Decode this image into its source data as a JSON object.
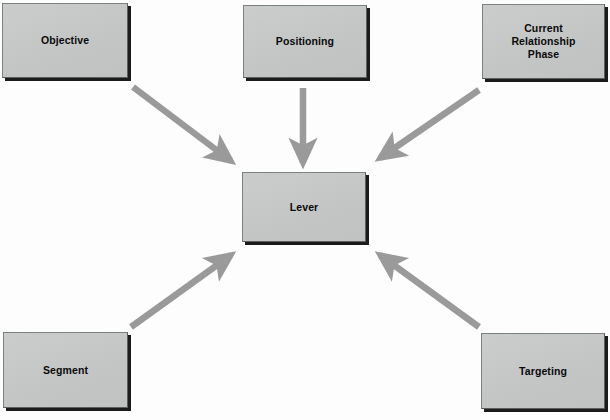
{
  "diagram": {
    "background_color": "#fdfdfd",
    "node_fill_color": "#c7c9c9",
    "node_border_color": "#7d8080",
    "node_shadow_color": "#1b1b1b",
    "arrow_color": "#9a9a9a",
    "label_color": "#0a0a0a",
    "nodes": [
      {
        "id": "objective",
        "label": "Objective"
      },
      {
        "id": "positioning",
        "label": "Positioning"
      },
      {
        "id": "crp",
        "label": "Current\nRelationship\nPhase"
      },
      {
        "id": "lever",
        "label": "Lever"
      },
      {
        "id": "segment",
        "label": "Segment"
      },
      {
        "id": "targeting",
        "label": "Targeting"
      }
    ],
    "edges": [
      {
        "id": "objective-to-lever",
        "from": "Objective",
        "to": "Lever",
        "direction": "down-right"
      },
      {
        "id": "positioning-to-lever",
        "from": "Positioning",
        "to": "Lever",
        "direction": "down"
      },
      {
        "id": "crp-to-lever",
        "from": "Current Relationship Phase",
        "to": "Lever",
        "direction": "down-left"
      },
      {
        "id": "segment-to-lever",
        "from": "Segment",
        "to": "Lever",
        "direction": "up-right"
      },
      {
        "id": "targeting-to-lever",
        "from": "Targeting",
        "to": "Lever",
        "direction": "up-left"
      }
    ]
  }
}
